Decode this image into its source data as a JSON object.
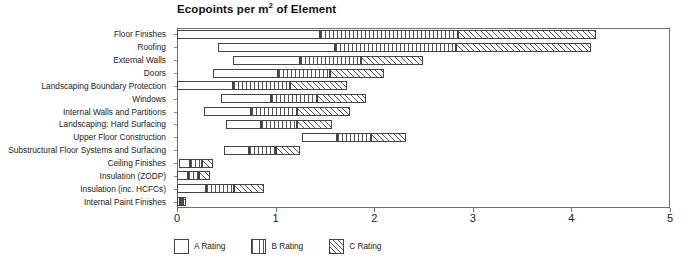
{
  "chart_data": {
    "type": "bar",
    "orientation": "horizontal",
    "stacked": true,
    "title": "Ecopoints per m2 of Element",
    "title_prefix": "Ecopoints per m",
    "title_sup": "2",
    "title_suffix": " of Element",
    "xlabel": "",
    "ylabel": "",
    "xlim": [
      0,
      5
    ],
    "xticks": [
      0,
      1,
      2,
      3,
      4,
      5
    ],
    "xticklabels": [
      "0",
      "1",
      "2",
      "3",
      "4",
      "5"
    ],
    "grid": false,
    "legend_position": "bottom-left",
    "categories": [
      "Floor Finishes",
      "Roofing",
      "External Walls",
      "Doors",
      "Landscaping Boundary Protection",
      "Windows",
      "Internal Walls and Partitions",
      "Landscaping: Hard Surfacing",
      "Upper Floor Construction",
      "Substructural Floor Systems and Surfacing",
      "Ceiling Finishes",
      "Insulation (ZODP)",
      "Insulation (inc. HCFCs)",
      "Internal Paint Finishes"
    ],
    "series": [
      {
        "name": "A Rating",
        "pattern": "dotted",
        "offsets": [
          0.0,
          0.42,
          0.57,
          0.37,
          0.0,
          0.45,
          0.27,
          0.5,
          1.27,
          0.48,
          0.02,
          0.0,
          0.0,
          0.0
        ],
        "values": [
          1.45,
          1.18,
          0.68,
          0.65,
          0.57,
          0.5,
          0.48,
          0.35,
          0.35,
          0.25,
          0.11,
          0.11,
          0.29,
          0.03
        ]
      },
      {
        "name": "B Rating",
        "pattern": "vertical-lines",
        "values": [
          1.4,
          1.23,
          0.62,
          0.53,
          0.58,
          0.47,
          0.47,
          0.37,
          0.35,
          0.27,
          0.12,
          0.11,
          0.29,
          0.03
        ]
      },
      {
        "name": "C Rating",
        "pattern": "diagonal-hatch",
        "values": [
          1.4,
          1.37,
          0.63,
          0.55,
          0.57,
          0.5,
          0.53,
          0.35,
          0.35,
          0.25,
          0.12,
          0.11,
          0.3,
          0.03
        ]
      }
    ],
    "bar_totals_end": [
      4.25,
      4.2,
      2.5,
      2.1,
      1.72,
      1.92,
      1.75,
      1.57,
      2.32,
      1.25,
      0.37,
      0.33,
      0.88,
      0.09
    ]
  },
  "legend": {
    "items": [
      {
        "label": "A Rating",
        "swatch": "a-rating-swatch"
      },
      {
        "label": "B Rating",
        "swatch": "b-rating-swatch"
      },
      {
        "label": "C Rating",
        "swatch": "c-rating-swatch"
      }
    ]
  }
}
